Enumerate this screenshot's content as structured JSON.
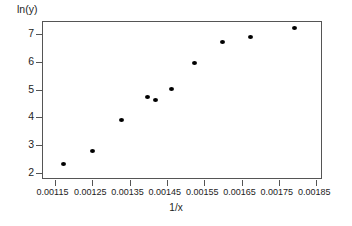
{
  "chart_data": {
    "type": "scatter",
    "title": "",
    "xlabel": "1/x",
    "ylabel": "ln(y)",
    "xlim": [
      0.001115,
      0.001865
    ],
    "ylim": [
      1.78,
      7.48
    ],
    "grid": false,
    "legend": "none",
    "x_ticks": [
      "0.00115",
      "0.00125",
      "0.00135",
      "0.00145",
      "0.00155",
      "0.00165",
      "0.00175",
      "0.00185"
    ],
    "x_tick_values": [
      0.00115,
      0.00125,
      0.00135,
      0.00145,
      0.00155,
      0.00165,
      0.00175,
      0.00185
    ],
    "y_ticks": [
      "7",
      "6",
      "5",
      "4",
      "3",
      "2"
    ],
    "y_tick_values": [
      7,
      6,
      5,
      4,
      3,
      2
    ],
    "x": [
      0.001173,
      0.00125,
      0.001328,
      0.001398,
      0.001418,
      0.001463,
      0.001523,
      0.001598,
      0.001673,
      0.00179
    ],
    "values": [
      2.31,
      2.78,
      3.92,
      4.75,
      4.63,
      5.01,
      5.98,
      6.72,
      6.9,
      7.22
    ],
    "marker": "filled-circle",
    "marker_color": "#000000",
    "axis_color": "#555555"
  }
}
